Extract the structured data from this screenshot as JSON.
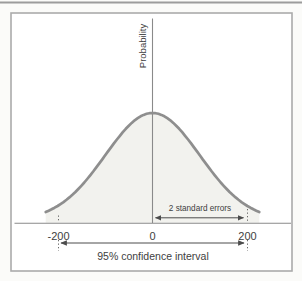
{
  "page": {
    "background": "#fbfbf9",
    "frame_border_color": "#ababab",
    "top_rule_color": "#9c9c9c"
  },
  "labels": {
    "ylabel": "Probability",
    "tick_neg200": "-200",
    "tick_zero": "0",
    "tick_pos200": "200",
    "standard_errors": "2 standard errors",
    "confidence_interval": "95% confidence interval"
  },
  "chart_data": {
    "type": "area",
    "curve": "gaussian",
    "title": "",
    "xlabel": "",
    "ylabel": "Probability",
    "x_ticks": [
      -200,
      0,
      200
    ],
    "x_tick_labels": [
      "-200",
      "0",
      "200"
    ],
    "grid": false,
    "legend": false,
    "gaussian": {
      "mean": 0,
      "sd": 100,
      "x_range": [
        -226,
        226
      ]
    },
    "fill_color": "#f2f2ee",
    "stroke_color": "#8e8e8e",
    "axis_color": "#8a8a8a",
    "annotation_color": "#4c4c4c",
    "annotations": [
      {
        "type": "double-arrow",
        "label": "2 standard errors",
        "from_x": 0,
        "to_x": 200
      },
      {
        "type": "double-arrow",
        "label": "95% confidence interval",
        "from_x": -200,
        "to_x": 200
      }
    ]
  }
}
